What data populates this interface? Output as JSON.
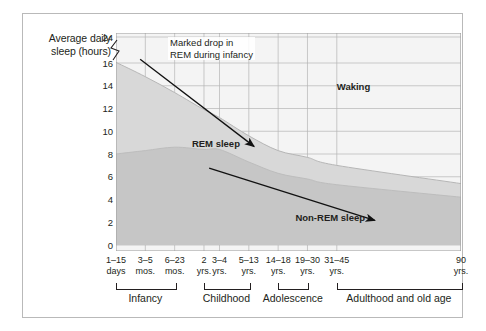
{
  "figure": {
    "axis_title": "Average\ndaily sleep\n(hours)"
  },
  "chart_data": {
    "type": "area",
    "title": "",
    "subtitle": "",
    "xlabel": "",
    "ylabel": "Average daily sleep (hours)",
    "ylim": [
      0,
      24
    ],
    "y_axis_break": true,
    "y_break_between": [
      16,
      24
    ],
    "yticks": [
      "0",
      "2",
      "4",
      "6",
      "8",
      "10",
      "12",
      "14",
      "16",
      "24"
    ],
    "ytick_values": [
      0,
      2,
      4,
      6,
      8,
      10,
      12,
      14,
      16,
      24
    ],
    "grid": true,
    "legend_position": "inline-labels",
    "categories": [
      "1–15\ndays",
      "3–5\nmos.",
      "6–23\nmos.",
      "2\nyrs.",
      "3–4\nyrs.",
      "5–13\nyrs.",
      "14–18\nyrs.",
      "19–30\nyrs.",
      "31–45\nyrs.",
      "90\nyrs."
    ],
    "series": [
      {
        "name": "Non-REM sleep",
        "values": [
          8.0,
          8.3,
          8.6,
          8.4,
          8.4,
          7.3,
          6.3,
          5.8,
          5.3,
          4.2
        ],
        "color": "#c9c9c9"
      },
      {
        "name": "REM sleep",
        "values": [
          8.2,
          6.5,
          4.8,
          3.5,
          2.8,
          2.3,
          2.0,
          1.9,
          1.7,
          1.2
        ],
        "color": "#d6d6d6"
      }
    ],
    "total_sleep": {
      "name": "Total sleep (top of band)",
      "values": [
        16.2,
        14.8,
        13.4,
        11.9,
        11.2,
        9.6,
        8.3,
        7.7,
        7.0,
        5.4
      ]
    },
    "region_labels": [
      {
        "text": "Waking",
        "x_frac": 0.64,
        "y_frac": 0.22
      },
      {
        "text": "REM sleep",
        "x_frac": 0.22,
        "y_frac": 0.48
      },
      {
        "text": "Non-REM sleep",
        "x_frac": 0.52,
        "y_frac": 0.82
      }
    ],
    "annotations": [
      {
        "text": "Marked drop in\nREM during infancy",
        "line1": "Marked drop in",
        "line2": "REM during infancy",
        "arrow": {
          "x1_frac": 0.07,
          "y1_frac": 0.12,
          "x2_frac": 0.4,
          "y2_frac": 0.52
        }
      },
      {
        "arrow": {
          "x1_frac": 0.27,
          "y1_frac": 0.62,
          "x2_frac": 0.75,
          "y2_frac": 0.86
        }
      }
    ],
    "stages": [
      {
        "label": "Infancy",
        "start_cat": 0,
        "end_cat": 2
      },
      {
        "label": "Childhood",
        "start_cat": 3,
        "end_cat": 5
      },
      {
        "label": "Adolescence",
        "start_cat": 6,
        "end_cat": 7
      },
      {
        "label": "Adulthood and old age",
        "start_cat": 8,
        "end_cat": 9
      }
    ],
    "colors": {
      "rem_band": "#d8d8d8",
      "nonrem_band": "#c6c6c6",
      "waking": "#f3f3f3",
      "grid": "#b5b5b5",
      "text": "#231f20",
      "border": "#b9b9b9"
    }
  }
}
